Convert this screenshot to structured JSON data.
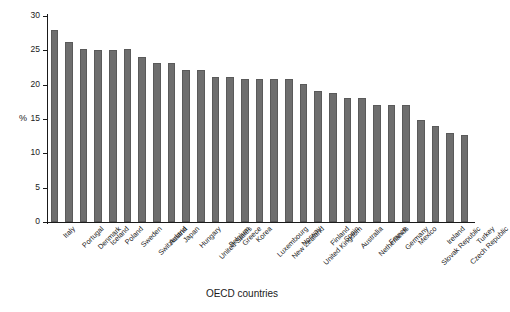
{
  "chart_data": {
    "type": "bar",
    "title": "",
    "subtitle": "",
    "xlabel": "OECD countries",
    "ylabel": "%",
    "ylim": [
      0,
      30
    ],
    "yticks": [
      0,
      5,
      10,
      15,
      20,
      25,
      30
    ],
    "grid": false,
    "legend": null,
    "bar_color": "#6e6e6e",
    "categories": [
      "Italy",
      "Portugal",
      "Denmark",
      "Iceland",
      "Poland",
      "Sweden",
      "Switzerland",
      "Austria",
      "Japan",
      "Hungary",
      "United States",
      "Belgium",
      "Greece",
      "Korea",
      "Luxembourg",
      "New Zealand",
      "Norway",
      "United Kingdom",
      "Finland",
      "Spain",
      "Australia",
      "Netherlands",
      "France",
      "Germany",
      "Mexico",
      "Slovak Republic",
      "Ireland",
      "Czech Republic",
      "Turkey"
    ],
    "values": [
      27.9,
      26.2,
      25.2,
      25.1,
      25.1,
      25.2,
      24.1,
      23.2,
      23.1,
      22.1,
      22.1,
      21.1,
      21.1,
      20.8,
      20.8,
      20.8,
      20.8,
      20.1,
      19.1,
      18.8,
      18.0,
      18.0,
      17.0,
      17.0,
      17.0,
      14.9,
      14.0,
      12.9,
      12.6
    ]
  }
}
